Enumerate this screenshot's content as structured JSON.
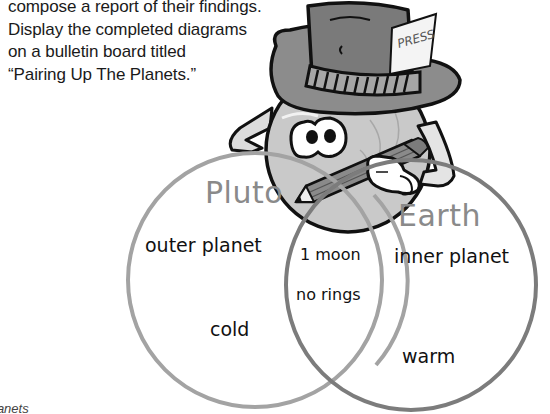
{
  "intro_text": {
    "lines": [
      "compose a report of their findings.",
      "Display the completed diagrams",
      "on a bulletin board titled",
      "“Pairing Up The Planets.”"
    ]
  },
  "footer_partial": "lanets",
  "illustration": {
    "character": "planet-reporter",
    "hat_card_text": "PRESS"
  },
  "venn_diagram": {
    "left_circle": {
      "title": "Pluto",
      "color": "#a3a3a3",
      "items": [
        "outer planet",
        "cold"
      ]
    },
    "right_circle": {
      "title": "Earth",
      "color": "#7c7c7c",
      "items": [
        "inner planet",
        "warm"
      ]
    },
    "overlap": {
      "items": [
        "1 moon",
        "no rings"
      ]
    }
  }
}
